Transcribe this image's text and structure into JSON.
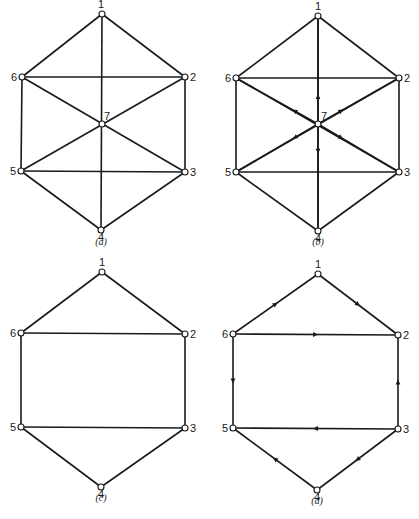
{
  "figure": {
    "graphs": [
      {
        "id": "a",
        "caption": "(a)",
        "caption_pos": [
          101,
          245
        ],
        "nodes": [
          {
            "id": "1",
            "x": 102,
            "y": 14,
            "label_dx": -1,
            "label_dy": -6,
            "anchor": "middle"
          },
          {
            "id": "2",
            "x": 185,
            "y": 77,
            "label_dx": 5,
            "label_dy": 4,
            "anchor": "start"
          },
          {
            "id": "3",
            "x": 185,
            "y": 172,
            "label_dx": 5,
            "label_dy": 4,
            "anchor": "start"
          },
          {
            "id": "4",
            "x": 101,
            "y": 230,
            "label_dx": 0,
            "label_dy": 11,
            "anchor": "middle"
          },
          {
            "id": "5",
            "x": 21,
            "y": 171,
            "label_dx": -5,
            "label_dy": 4,
            "anchor": "end"
          },
          {
            "id": "6",
            "x": 22,
            "y": 77,
            "label_dx": -5,
            "label_dy": 4,
            "anchor": "end"
          },
          {
            "id": "7",
            "x": 102,
            "y": 124,
            "label_dx": 2,
            "label_dy": -4,
            "anchor": "start"
          }
        ],
        "edges": [
          [
            "1",
            "2"
          ],
          [
            "2",
            "3"
          ],
          [
            "3",
            "4"
          ],
          [
            "4",
            "5"
          ],
          [
            "5",
            "6"
          ],
          [
            "6",
            "1"
          ],
          [
            "6",
            "2"
          ],
          [
            "5",
            "3"
          ],
          [
            "1",
            "4"
          ],
          [
            "6",
            "3"
          ],
          [
            "2",
            "5"
          ]
        ]
      },
      {
        "id": "b",
        "caption": "(b)",
        "caption_pos": [
          318,
          245
        ],
        "nodes": [
          {
            "id": "1",
            "x": 318,
            "y": 16,
            "label_dx": 0,
            "label_dy": -6,
            "anchor": "middle"
          },
          {
            "id": "2",
            "x": 399,
            "y": 78,
            "label_dx": 5,
            "label_dy": 4,
            "anchor": "start"
          },
          {
            "id": "3",
            "x": 399,
            "y": 172,
            "label_dx": 5,
            "label_dy": 4,
            "anchor": "start"
          },
          {
            "id": "4",
            "x": 318,
            "y": 231,
            "label_dx": 0,
            "label_dy": 11,
            "anchor": "middle"
          },
          {
            "id": "5",
            "x": 236,
            "y": 172,
            "label_dx": -5,
            "label_dy": 4,
            "anchor": "end"
          },
          {
            "id": "6",
            "x": 236,
            "y": 78,
            "label_dx": -5,
            "label_dy": 4,
            "anchor": "end"
          },
          {
            "id": "7",
            "x": 318,
            "y": 124,
            "label_dx": 3,
            "label_dy": -4,
            "anchor": "start"
          }
        ],
        "edges": [
          [
            "1",
            "2"
          ],
          [
            "2",
            "3"
          ],
          [
            "3",
            "4"
          ],
          [
            "4",
            "5"
          ],
          [
            "5",
            "6"
          ],
          [
            "6",
            "1"
          ],
          [
            "6",
            "2"
          ],
          [
            "5",
            "3"
          ],
          [
            "1",
            "4"
          ],
          [
            "6",
            "3"
          ],
          [
            "2",
            "5"
          ]
        ],
        "directed_edges": [
          [
            "7",
            "1"
          ],
          [
            "7",
            "2"
          ],
          [
            "7",
            "3"
          ],
          [
            "7",
            "4"
          ],
          [
            "7",
            "5"
          ],
          [
            "7",
            "6"
          ]
        ]
      },
      {
        "id": "c",
        "caption": "(c)",
        "caption_pos": [
          101,
          501
        ],
        "nodes": [
          {
            "id": "1",
            "x": 102,
            "y": 272,
            "label_dx": 0,
            "label_dy": -6,
            "anchor": "middle"
          },
          {
            "id": "2",
            "x": 185,
            "y": 334,
            "label_dx": 5,
            "label_dy": 4,
            "anchor": "start"
          },
          {
            "id": "3",
            "x": 185,
            "y": 428,
            "label_dx": 5,
            "label_dy": 4,
            "anchor": "start"
          },
          {
            "id": "4",
            "x": 101,
            "y": 487,
            "label_dx": 0,
            "label_dy": 11,
            "anchor": "middle"
          },
          {
            "id": "5",
            "x": 21,
            "y": 427,
            "label_dx": -5,
            "label_dy": 4,
            "anchor": "end"
          },
          {
            "id": "6",
            "x": 21,
            "y": 333,
            "label_dx": -5,
            "label_dy": 4,
            "anchor": "end"
          }
        ],
        "edges": [
          [
            "1",
            "2"
          ],
          [
            "2",
            "3"
          ],
          [
            "3",
            "4"
          ],
          [
            "4",
            "5"
          ],
          [
            "5",
            "6"
          ],
          [
            "6",
            "1"
          ],
          [
            "6",
            "2"
          ],
          [
            "5",
            "3"
          ]
        ]
      },
      {
        "id": "d",
        "caption": "(d)",
        "caption_pos": [
          317,
          504
        ],
        "nodes": [
          {
            "id": "1",
            "x": 318,
            "y": 274,
            "label_dx": 0,
            "label_dy": -6,
            "anchor": "middle"
          },
          {
            "id": "2",
            "x": 398,
            "y": 335,
            "label_dx": 5,
            "label_dy": 4,
            "anchor": "start"
          },
          {
            "id": "3",
            "x": 398,
            "y": 429,
            "label_dx": 5,
            "label_dy": 4,
            "anchor": "start"
          },
          {
            "id": "4",
            "x": 317,
            "y": 490,
            "label_dx": 0,
            "label_dy": 11,
            "anchor": "middle"
          },
          {
            "id": "5",
            "x": 233,
            "y": 428,
            "label_dx": -5,
            "label_dy": 4,
            "anchor": "end"
          },
          {
            "id": "6",
            "x": 233,
            "y": 334,
            "label_dx": -5,
            "label_dy": 4,
            "anchor": "end"
          }
        ],
        "edges": [],
        "directed_edges": [
          [
            "6",
            "1"
          ],
          [
            "1",
            "2"
          ],
          [
            "6",
            "2"
          ],
          [
            "6",
            "5"
          ],
          [
            "3",
            "2"
          ],
          [
            "3",
            "5"
          ],
          [
            "3",
            "4"
          ],
          [
            "4",
            "5"
          ]
        ]
      }
    ]
  }
}
